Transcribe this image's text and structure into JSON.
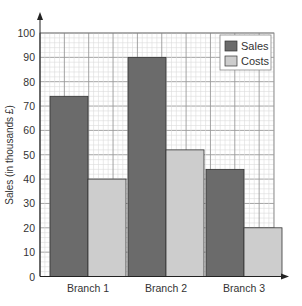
{
  "chart_data": {
    "type": "bar",
    "title": "",
    "xlabel": "",
    "ylabel": "Sales (in thousands £)",
    "categories": [
      "Branch 1",
      "Branch 2",
      "Branch 3"
    ],
    "series": [
      {
        "name": "Sales",
        "values": [
          74,
          90,
          44
        ],
        "color": "#6b6b6b"
      },
      {
        "name": "Costs",
        "values": [
          40,
          52,
          20
        ],
        "color": "#cdcdcd"
      }
    ],
    "ylim": [
      0,
      100
    ],
    "yticks": [
      0,
      10,
      20,
      30,
      40,
      50,
      60,
      70,
      80,
      90,
      100
    ],
    "grid": true,
    "minor_grid_step": 2,
    "legend_position": "top-right"
  }
}
